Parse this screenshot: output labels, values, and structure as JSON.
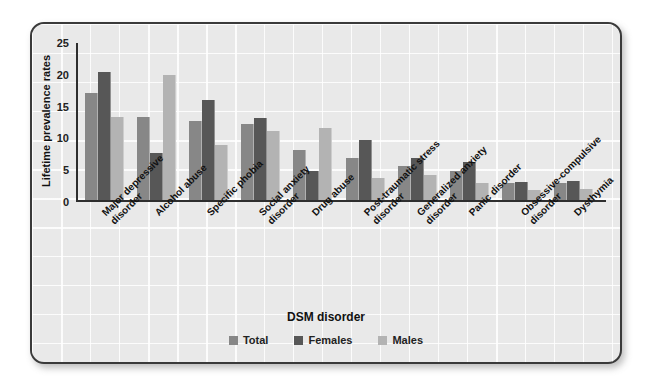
{
  "chart_data": {
    "type": "bar",
    "title": "",
    "xlabel": "DSM disorder",
    "ylabel": "Lifetime prevalence rates",
    "ylim": [
      0,
      25
    ],
    "yticks": [
      0,
      5,
      10,
      15,
      20,
      25
    ],
    "grid": true,
    "legend_position": "bottom",
    "categories": [
      "Major depressive\ndisorder",
      "Alcohol abuse",
      "Specific phobia",
      "Social anxiety\ndisorder",
      "Drug abuse",
      "Post-traumatic stress\ndisorder",
      "Generalized anxiety\ndisorder",
      "Panic disorder",
      "Obsessive-compulsive\ndisorder",
      "Dysthymia"
    ],
    "series": [
      {
        "name": "Total",
        "color": "#878787",
        "values": [
          16.9,
          13.1,
          12.4,
          11.9,
          7.8,
          6.6,
          5.4,
          4.6,
          2.6,
          2.6
        ]
      },
      {
        "name": "Females",
        "color": "#575757",
        "values": [
          20.1,
          7.4,
          15.7,
          12.9,
          4.6,
          9.5,
          6.6,
          5.9,
          2.8,
          3.0
        ]
      },
      {
        "name": "Males",
        "color": "#b3b3b3",
        "values": [
          13.1,
          19.6,
          8.7,
          10.9,
          11.3,
          3.4,
          3.9,
          2.7,
          1.5,
          1.7
        ]
      }
    ]
  },
  "legend": {
    "items": [
      {
        "label": "Total"
      },
      {
        "label": "Females"
      },
      {
        "label": "Males"
      }
    ]
  },
  "axes": {
    "y_title": "Lifetime prevalence rates",
    "x_title": "DSM disorder",
    "y_ticks": [
      "25",
      "20",
      "15",
      "10",
      "5",
      "0"
    ]
  }
}
